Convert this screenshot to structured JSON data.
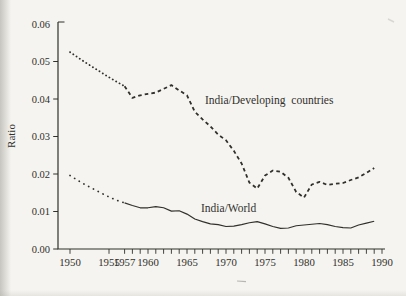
{
  "chart_data": {
    "type": "line",
    "title": "",
    "xlabel": "",
    "ylabel": "Ratio",
    "xlim": [
      1948.5,
      1991
    ],
    "ylim": [
      0,
      0.06
    ],
    "grid": false,
    "legend_position": "inline-annotations",
    "y_axis": {
      "tick_values": [
        0,
        0.01,
        0.02,
        0.03,
        0.04,
        0.05,
        0.06
      ],
      "tick_labels": [
        "0.00",
        "0.01",
        "0.02",
        "0.03",
        "0.04",
        "0.05",
        "0.06"
      ]
    },
    "x_axis": {
      "tick_years": [
        1950,
        1955,
        1957,
        1958,
        1959,
        1960,
        1961,
        1962,
        1963,
        1964,
        1965,
        1966,
        1967,
        1968,
        1969,
        1970,
        1971,
        1972,
        1973,
        1974,
        1975,
        1976,
        1977,
        1978,
        1979,
        1980,
        1981,
        1982,
        1983,
        1984,
        1985,
        1986,
        1987,
        1988,
        1989,
        1990
      ],
      "label_years": [
        1950,
        1955,
        1957,
        1960,
        1965,
        1970,
        1975,
        1980,
        1985,
        1990
      ],
      "labels": [
        "1950",
        "1955",
        "1957",
        "1960",
        "1965",
        "1970",
        "1975",
        "1980",
        "1985",
        "1990"
      ]
    },
    "series": [
      {
        "id": "india-developing-countries",
        "name": "India/Developing countries",
        "segments": [
          {
            "style": "dotted",
            "years": [
              1950,
              1951,
              1952,
              1953,
              1954,
              1955,
              1956,
              1957
            ],
            "values": [
              0.0525,
              0.0511,
              0.0497,
              0.0484,
              0.0471,
              0.0458,
              0.0446,
              0.0434
            ]
          },
          {
            "style": "dashed",
            "years": [
              1957,
              1958,
              1959,
              1960,
              1961,
              1962,
              1963,
              1964,
              1965,
              1966,
              1967,
              1968,
              1969,
              1970,
              1971,
              1972,
              1973,
              1974,
              1975,
              1976,
              1977,
              1978,
              1979,
              1980,
              1981,
              1982,
              1983,
              1984,
              1985,
              1986,
              1987,
              1988,
              1989
            ],
            "values": [
              0.0434,
              0.0403,
              0.041,
              0.0414,
              0.0417,
              0.0427,
              0.0437,
              0.0423,
              0.041,
              0.0366,
              0.0346,
              0.0327,
              0.0305,
              0.029,
              0.0262,
              0.0228,
              0.0177,
              0.0161,
              0.0196,
              0.0209,
              0.0206,
              0.019,
              0.0152,
              0.0137,
              0.0172,
              0.0179,
              0.0171,
              0.0174,
              0.0176,
              0.0184,
              0.0191,
              0.0203,
              0.0216
            ]
          }
        ]
      },
      {
        "id": "india-world",
        "name": "India/World",
        "segments": [
          {
            "style": "dotted-sparse",
            "years": [
              1950,
              1951,
              1952,
              1953,
              1954,
              1955,
              1956,
              1957
            ],
            "values": [
              0.0196,
              0.0183,
              0.0171,
              0.016,
              0.0149,
              0.0139,
              0.013,
              0.0123
            ]
          },
          {
            "style": "solid",
            "years": [
              1957,
              1958,
              1959,
              1960,
              1961,
              1962,
              1963,
              1964,
              1965,
              1966,
              1967,
              1968,
              1969,
              1970,
              1971,
              1972,
              1973,
              1974,
              1975,
              1976,
              1977,
              1978,
              1979,
              1980,
              1981,
              1982,
              1983,
              1984,
              1985,
              1986,
              1987,
              1988,
              1989
            ],
            "values": [
              0.0123,
              0.0116,
              0.011,
              0.011,
              0.0113,
              0.011,
              0.0101,
              0.0102,
              0.0093,
              0.008,
              0.0073,
              0.0067,
              0.0065,
              0.006,
              0.0061,
              0.0065,
              0.007,
              0.0073,
              0.0067,
              0.006,
              0.0055,
              0.0056,
              0.0062,
              0.0064,
              0.0066,
              0.0068,
              0.0065,
              0.006,
              0.0057,
              0.0056,
              0.0064,
              0.0069,
              0.0074
            ]
          }
        ]
      }
    ],
    "annotations": [
      {
        "text": "India/Developing countries",
        "year": 1967.3,
        "value": 0.0388,
        "anchor": "start"
      },
      {
        "text": "India/World",
        "year": 1966.8,
        "value": 0.0098,
        "anchor": "start"
      }
    ],
    "ink_color": "#31302b",
    "paper_color": "#f5f4f0"
  }
}
